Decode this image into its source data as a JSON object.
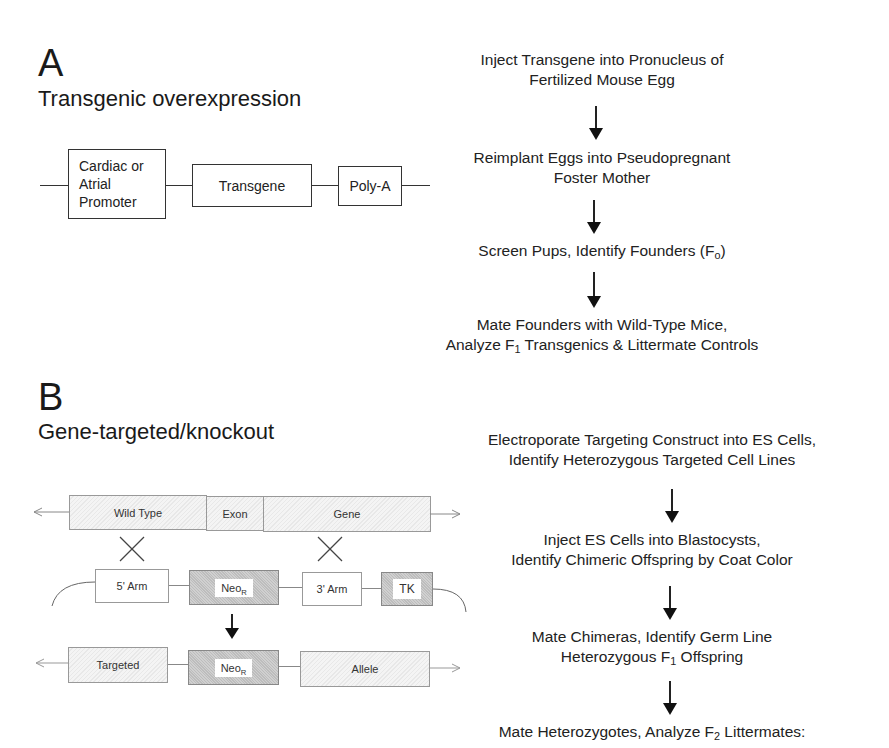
{
  "panel_a": {
    "letter": "A",
    "title": "Transgenic overexpression",
    "construct": {
      "promoter_box": [
        "Cardiac or",
        "Atrial",
        "Promoter"
      ],
      "transgene_box": "Transgene",
      "polya_box": "Poly-A"
    },
    "steps": [
      {
        "line1": "Inject Transgene into Pronucleus of",
        "line2": "Fertilized Mouse Egg"
      },
      {
        "line1": "Reimplant Eggs into Pseudopregnant",
        "line2": "Foster Mother"
      },
      {
        "line1_pre": "Screen Pups, Identify Founders (F",
        "line1_sub": "o",
        "line1_post": ")"
      },
      {
        "line1": "Mate Founders with Wild-Type Mice,",
        "line2_pre": "Analyze F",
        "line2_sub": "1",
        "line2_post": " Transgenics & Littermate Controls"
      }
    ]
  },
  "panel_b": {
    "letter": "B",
    "title": "Gene-targeted/knockout",
    "wild_type_row": [
      "Wild Type",
      "Exon",
      "Gene"
    ],
    "construct_row": {
      "five_arm": "5' Arm",
      "neo": "Neo",
      "neo_sub": "R",
      "three_arm": "3' Arm",
      "tk": "TK"
    },
    "targeted_row": {
      "targeted": "Targeted",
      "neo": "Neo",
      "neo_sub": "R",
      "allele": "Allele"
    },
    "steps": [
      {
        "line1": "Electroporate Targeting Construct into ES Cells,",
        "line2": "Identify Heterozygous Targeted Cell Lines"
      },
      {
        "line1": "Inject ES Cells into Blastocysts,",
        "line2": "Identify Chimeric Offspring by Coat Color"
      },
      {
        "line1": "Mate Chimeras, Identify Germ Line",
        "line2_pre": "Heterozygous F",
        "line2_sub": "1",
        "line2_post": " Offspring"
      },
      {
        "line1_pre": "Mate Heterozygotes, Analyze F",
        "line1_sub": "2",
        "line1_post": " Littermates:"
      }
    ]
  }
}
